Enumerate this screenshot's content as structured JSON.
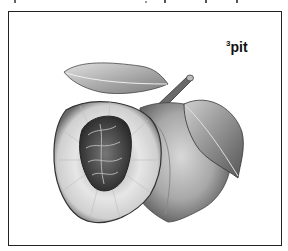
{
  "illustration": {
    "subject": "peach with cut half showing pit, stem and leaves",
    "label": {
      "superscript": "3",
      "text": "pit"
    },
    "colors": {
      "frame": "#222222",
      "background": "#ffffff",
      "ink": "#333333"
    }
  }
}
